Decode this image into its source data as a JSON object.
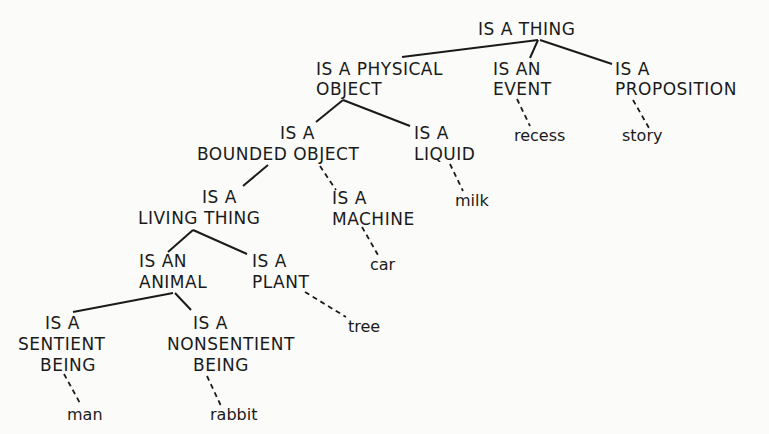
{
  "diagram": {
    "type": "semantic-hierarchy-tree",
    "nodes": {
      "thing": "IS A THING",
      "physical_object_1": "IS A PHYSICAL",
      "physical_object_2": "OBJECT",
      "event_1": "IS AN",
      "event_2": "EVENT",
      "proposition_1": "IS A",
      "proposition_2": "PROPOSITION",
      "bounded_1": "IS A",
      "bounded_2": "BOUNDED OBJECT",
      "liquid_1": "IS A",
      "liquid_2": "LIQUID",
      "living_1": "IS A",
      "living_2": "LIVING THING",
      "machine_1": "IS A",
      "machine_2": "MACHINE",
      "animal_1": "IS AN",
      "animal_2": "ANIMAL",
      "plant_1": "IS A",
      "plant_2": "PLANT",
      "sentient_1": "IS A",
      "sentient_2": "SENTIENT",
      "sentient_3": "BEING",
      "nonsentient_1": "IS A",
      "nonsentient_2": "NONSENTIENT",
      "nonsentient_3": "BEING"
    },
    "leaves": {
      "recess": "recess",
      "story": "story",
      "milk": "milk",
      "car": "car",
      "tree": "tree",
      "man": "man",
      "rabbit": "rabbit"
    },
    "edges": [
      [
        "IS A THING",
        "IS A PHYSICAL OBJECT"
      ],
      [
        "IS A THING",
        "IS AN EVENT"
      ],
      [
        "IS A THING",
        "IS A PROPOSITION"
      ],
      [
        "IS A PHYSICAL OBJECT",
        "IS A BOUNDED OBJECT"
      ],
      [
        "IS A PHYSICAL OBJECT",
        "IS A LIQUID"
      ],
      [
        "IS A BOUNDED OBJECT",
        "IS A LIVING THING"
      ],
      [
        "IS A BOUNDED OBJECT",
        "IS A MACHINE",
        "dashed"
      ],
      [
        "IS A LIVING THING",
        "IS AN ANIMAL"
      ],
      [
        "IS A LIVING THING",
        "IS A PLANT"
      ],
      [
        "IS AN ANIMAL",
        "IS A SENTIENT BEING"
      ],
      [
        "IS AN ANIMAL",
        "IS A NONSENTIENT BEING"
      ],
      [
        "IS AN EVENT",
        "recess",
        "dashed"
      ],
      [
        "IS A PROPOSITION",
        "story",
        "dashed"
      ],
      [
        "IS A LIQUID",
        "milk",
        "dashed"
      ],
      [
        "IS A MACHINE",
        "car",
        "dashed"
      ],
      [
        "IS A PLANT",
        "tree",
        "dashed"
      ],
      [
        "IS A SENTIENT BEING",
        "man",
        "dashed"
      ],
      [
        "IS A NONSENTIENT BEING",
        "rabbit",
        "dashed"
      ]
    ]
  }
}
